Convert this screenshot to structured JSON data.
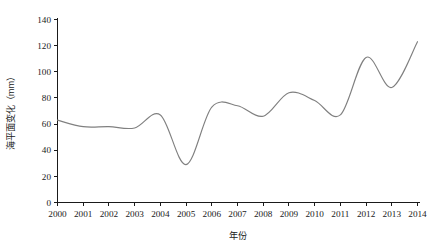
{
  "chart_data": {
    "type": "line",
    "title": "",
    "xlabel": "年份",
    "ylabel": "海平面变化（mm）",
    "categories": [
      "2000",
      "2001",
      "2002",
      "2003",
      "2004",
      "2005",
      "2006",
      "2007",
      "2008",
      "2009",
      "2010",
      "2011",
      "2012",
      "2013",
      "2014"
    ],
    "x": [
      2000,
      2001,
      2002,
      2003,
      2004,
      2005,
      2006,
      2007,
      2008,
      2009,
      2010,
      2011,
      2012,
      2013,
      2014
    ],
    "values": [
      63,
      58,
      58,
      57,
      67,
      29,
      73,
      74,
      66,
      84,
      78,
      67,
      111,
      88,
      123
    ],
    "series": [
      {
        "name": "海平面变化",
        "values": [
          63,
          58,
          58,
          57,
          67,
          29,
          73,
          74,
          66,
          84,
          78,
          67,
          111,
          88,
          123
        ]
      }
    ],
    "ylim": [
      0,
      140
    ],
    "yticks": [
      0,
      20,
      40,
      60,
      80,
      100,
      120,
      140
    ],
    "ytick_labels": [
      "0",
      "20",
      "40",
      "60",
      "80",
      "100",
      "120",
      "140"
    ],
    "xlim": [
      2000,
      2014
    ],
    "xticks": [
      2000,
      2001,
      2002,
      2003,
      2004,
      2005,
      2006,
      2007,
      2008,
      2009,
      2010,
      2011,
      2012,
      2013,
      2014
    ],
    "grid": false,
    "legend": false,
    "line_color": "#808080",
    "axis_color": "#1a1a1a",
    "background": "#ffffff",
    "smoothing": "spline"
  }
}
